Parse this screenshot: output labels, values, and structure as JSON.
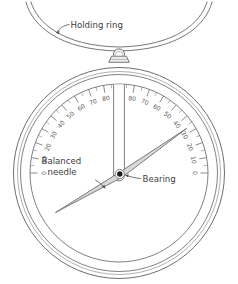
{
  "diagram": {
    "callouts": [
      {
        "id": "holding-ring",
        "text": "Holding ring"
      },
      {
        "id": "balanced-needle",
        "text_line1": "Balanced",
        "text_line2": "needle"
      },
      {
        "id": "bearing",
        "text": "Bearing"
      }
    ],
    "colors": {
      "stroke": "#4a4a4a",
      "light_stroke": "#8c8c8c",
      "needle_fill": "#d7d7d7",
      "body_fill": "#ffffff",
      "text": "#3d3d3d",
      "tick_text": "#5a5a5a",
      "background": "#ffffff"
    },
    "scale": {
      "description": "Graduated protractor scale, symmetric about bottom 90",
      "major_step": 10,
      "minor_step": 5,
      "left_values": [
        0,
        10,
        20,
        30,
        40,
        50,
        60,
        70,
        80
      ],
      "apex_value": 90,
      "right_values": [
        80,
        70,
        60,
        50,
        40,
        30,
        20,
        10,
        0
      ],
      "labels_ordered": [
        0,
        10,
        20,
        30,
        40,
        50,
        60,
        70,
        80,
        90,
        80,
        70,
        60,
        50,
        40,
        30,
        20,
        10,
        0
      ]
    },
    "needle": {
      "reading_degrees": 30,
      "pointer_side": "left",
      "angle_from_horizontal_deg": 22
    },
    "parts": [
      "holding-ring",
      "suspension-eyelet",
      "mounting-bracket",
      "instrument-body",
      "graduated-scale",
      "central-column",
      "strut-left",
      "strut-right",
      "balanced-needle",
      "bearing"
    ]
  }
}
